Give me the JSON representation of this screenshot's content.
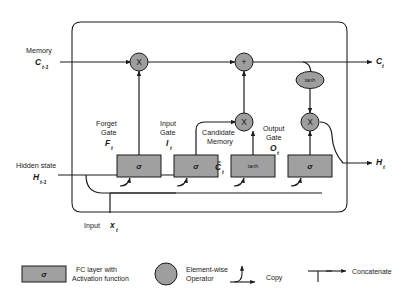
{
  "diagram": {
    "colors": {
      "node_fill": "#9e9e9e",
      "box_fill": "#a0a0a0",
      "stroke": "#1a1a1a",
      "background": "#ffffff"
    },
    "inputs": [
      {
        "id": "memory",
        "label": "Memory",
        "symbol": "C",
        "subscript": "t-1"
      },
      {
        "id": "hidden-state",
        "label": "Hidden state",
        "symbol": "H",
        "subscript": "t-1"
      },
      {
        "id": "input",
        "label": "Input",
        "symbol": "x",
        "subscript": "t"
      }
    ],
    "outputs": [
      {
        "id": "memory-out",
        "symbol": "C",
        "subscript": "t"
      },
      {
        "id": "hidden-out",
        "symbol": "H",
        "subscript": "t"
      }
    ],
    "gates": [
      {
        "id": "forget-gate",
        "name_line1": "Forget",
        "name_line2": "Gate",
        "symbol": "F",
        "subscript": "t",
        "activation": "σ"
      },
      {
        "id": "input-gate",
        "name_line1": "Input",
        "name_line2": "Gate",
        "symbol": "I",
        "subscript": "t",
        "activation": "σ"
      },
      {
        "id": "candidate-memory",
        "name_line1": "Candidate",
        "name_line2": "Memory",
        "symbol": "C̃",
        "subscript": "t",
        "activation": "tanh"
      },
      {
        "id": "output-gate",
        "name_line1": "Output",
        "name_line2": "Gate",
        "symbol": "O",
        "subscript": "t",
        "activation": "σ"
      }
    ],
    "operators": [
      {
        "id": "forget-multiply",
        "glyph": "X"
      },
      {
        "id": "memory-add",
        "glyph": "+"
      },
      {
        "id": "input-multiply",
        "glyph": "X"
      },
      {
        "id": "output-multiply",
        "glyph": "X"
      },
      {
        "id": "memory-tanh",
        "glyph": "tanh"
      }
    ]
  },
  "legend": {
    "items": [
      {
        "id": "fc-layer",
        "glyph": "σ",
        "line1": "FC layer with",
        "line2": "Activation function"
      },
      {
        "id": "elementwise",
        "glyph": "",
        "line1": "Element-wise",
        "line2": "Operator"
      },
      {
        "id": "copy",
        "glyph": "",
        "line1": "Copy",
        "line2": ""
      },
      {
        "id": "concatenate",
        "glyph": "",
        "line1": "Concatenate",
        "line2": ""
      }
    ]
  }
}
